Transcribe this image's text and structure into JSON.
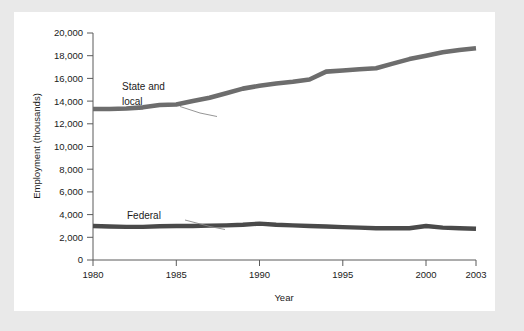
{
  "figure": {
    "background_color": "#e9e9e9",
    "card_color": "#ffffff",
    "axis_color": "#5a5a5a"
  },
  "chart_data": {
    "type": "line",
    "title": "",
    "xlabel": "Year",
    "ylabel": "Employment (thousands)",
    "xlim": [
      1980,
      2003
    ],
    "ylim": [
      0,
      20000
    ],
    "xticks": [
      1980,
      1985,
      1990,
      1995,
      2000,
      2003
    ],
    "xtick_labels": [
      "1980",
      "1985",
      "1990",
      "1995",
      "2000",
      "2003"
    ],
    "yticks": [
      0,
      2000,
      4000,
      6000,
      8000,
      10000,
      12000,
      14000,
      16000,
      18000,
      20000
    ],
    "ytick_labels": [
      "0",
      "2,000",
      "4,000",
      "6,000",
      "8,000",
      "10,000",
      "12,000",
      "14,000",
      "16,000",
      "18,000",
      "20,000"
    ],
    "grid": false,
    "legend_position": "inline-annotations",
    "x": [
      1980,
      1981,
      1982,
      1983,
      1984,
      1985,
      1986,
      1987,
      1988,
      1989,
      1990,
      1991,
      1992,
      1993,
      1994,
      1995,
      1996,
      1997,
      1998,
      1999,
      2000,
      2001,
      2002,
      2003
    ],
    "series": [
      {
        "name": "State and local",
        "color": "#6d6d6d",
        "values": [
          13300,
          13300,
          13350,
          13450,
          13650,
          13700,
          14000,
          14300,
          14700,
          15100,
          15350,
          15550,
          15700,
          15900,
          16600,
          16700,
          16800,
          16900,
          17300,
          17700,
          18000,
          18300,
          18500,
          18650
        ],
        "label_text_lines": [
          "State and",
          "local"
        ]
      },
      {
        "name": "Federal",
        "color": "#4a4a4a",
        "values": [
          3000,
          2950,
          2920,
          2920,
          2980,
          3000,
          3000,
          3030,
          3050,
          3100,
          3200,
          3100,
          3050,
          3000,
          2950,
          2900,
          2850,
          2800,
          2800,
          2800,
          3000,
          2850,
          2800,
          2750
        ],
        "label_text_lines": [
          "Federal"
        ]
      }
    ],
    "annotations": [
      {
        "name": "state-and-local-label",
        "lines": [
          "State and",
          "local"
        ]
      },
      {
        "name": "federal-label",
        "lines": [
          "Federal"
        ]
      }
    ]
  }
}
